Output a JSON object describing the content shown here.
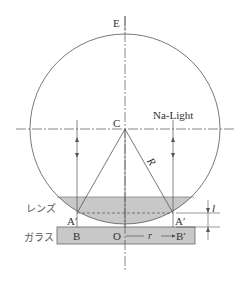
{
  "diagram": {
    "labels": {
      "E": "E",
      "C": "C",
      "light": "Na-Light",
      "R": "R",
      "lens": "レンズ",
      "glass": "ガラス",
      "A_left": "A′",
      "A_right": "A′",
      "B": "B",
      "O": "O",
      "r": "r",
      "B_prime": "B′",
      "l": "l"
    },
    "colors": {
      "line": "#555555",
      "lens_fill": "#c8c8c8",
      "glass_fill": "#c8c8c8",
      "background": "#ffffff"
    }
  }
}
